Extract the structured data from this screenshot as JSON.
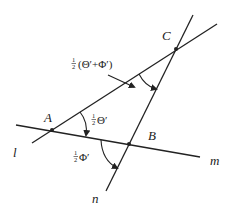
{
  "diagram": {
    "points": {
      "A": {
        "label": "A",
        "x": 52,
        "y": 130
      },
      "B": {
        "label": "B",
        "x": 129,
        "y": 144
      },
      "C": {
        "label": "C",
        "x": 176,
        "y": 49
      }
    },
    "lines": {
      "l": {
        "label": "l"
      },
      "m": {
        "label": "m"
      },
      "n": {
        "label": "n"
      }
    },
    "angles": {
      "half_theta": {
        "frac": "1",
        "den": "2",
        "symbol": "Θ′"
      },
      "half_phi": {
        "frac": "1",
        "den": "2",
        "symbol": "Φ′"
      },
      "half_sum": {
        "frac": "1",
        "den": "2",
        "symbol": "(Θ′+Φ′)"
      }
    },
    "colors": {
      "ink": "#222222",
      "background": "#ffffff"
    }
  }
}
